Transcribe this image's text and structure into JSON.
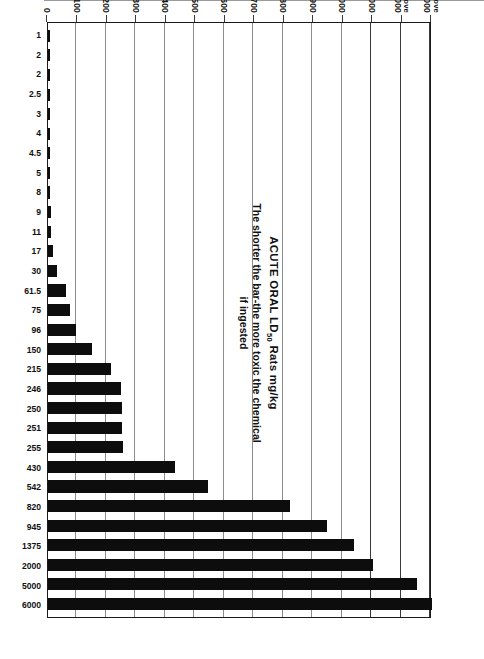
{
  "chart_data": {
    "type": "bar",
    "title_main": "ACUTE ORAL LD",
    "title_sub": "50",
    "title_tail": " Rats mg/kg",
    "subtitle_line1": "The shorter the bar-the more toxic the chemical",
    "subtitle_line2": "if ingested",
    "xlabel": "",
    "ylabel": "mg/kg",
    "grid": true,
    "legend": "none",
    "orientation": "rotated-90",
    "axis_note": "broken / non-linear value axis",
    "tick_labels": [
      "0",
      "100",
      "200",
      "300",
      "400",
      "500",
      "600",
      "700",
      "800",
      "900",
      "1000",
      "2000",
      "Above 4000",
      "Above 6000"
    ],
    "tick_values": [
      0,
      100,
      200,
      300,
      400,
      500,
      600,
      700,
      800,
      900,
      1000,
      2000,
      4000,
      6000
    ],
    "categories": [
      "aldicarb (Temik®)",
      "phorate (Thimet®)",
      "disulfoton (Di-Syston®)",
      "demeton (Systox®)",
      "mevinphos (Phosdrin®)",
      "ethyl parathion (Thiophos®)",
      "terbufos (Counter®)",
      "azinphos-methyl (Guthion®)",
      "fonophos (Dyfonate®)",
      "methyl parathion (Drexel M.P. 4E®)",
      "carbofuran (Furadan®)",
      "phosphamidon (Dimecron®)",
      "endosulfan (Thiodan®)",
      "ethoprop (Mocap®)",
      "esfenvalerate (Asana®)",
      "chlorpyrifos (Dursban®, Lorsban®)",
      "trichlorfon (Dylox®)",
      "dimethoate (Cygon®)",
      "carbaryl (Sevin®)",
      "chlordimeform (Galecron®)",
      "cypermethrin (Ammo®, Cymbush®)",
      "fenthion (Baytex®)",
      "permethrin (Ambush®, Pounce®)",
      "diazinon (Spectracide®)",
      "dicofol (Kelthane®)",
      "acephate (Orthene®)",
      "malathion (Cythion®)",
      "pirimiphos-methyl (Actellic®)",
      "tetradifon (Tedion®)",
      "methoxychlor (Marlate®)"
    ],
    "value_labels": [
      "1",
      "2",
      "2",
      "2.5",
      "3",
      "4",
      "4.5",
      "5",
      "8",
      "9",
      "11",
      "17",
      "30",
      "61.5",
      "75",
      "96",
      "150",
      "215",
      "246",
      "250",
      "251",
      "255",
      "430",
      "542",
      "820",
      "945",
      "1375",
      "2000",
      "5000",
      "6000"
    ],
    "values": [
      1,
      2,
      2,
      2.5,
      3,
      4,
      4.5,
      5,
      8,
      9,
      11,
      17,
      30,
      61.5,
      75,
      96,
      150,
      215,
      246,
      250,
      251,
      255,
      430,
      542,
      820,
      945,
      1375,
      2000,
      5000,
      6000
    ]
  },
  "colors": {
    "bar": "#0d0d0d",
    "frame": "#1a1a1a",
    "grid": "#8c8c8c",
    "background": "#ffffff"
  }
}
